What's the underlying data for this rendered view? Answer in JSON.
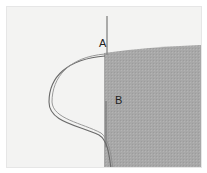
{
  "illustration": {
    "subject": "needle and thread at fabric edge",
    "labels": [
      {
        "id": "A",
        "text": "A"
      },
      {
        "id": "B",
        "text": "B"
      }
    ],
    "colors": {
      "background": "#f3f3f2",
      "fabric": "#a9a9a9",
      "thread": "#6a6a6a",
      "needle": "#8a8a8a"
    }
  }
}
